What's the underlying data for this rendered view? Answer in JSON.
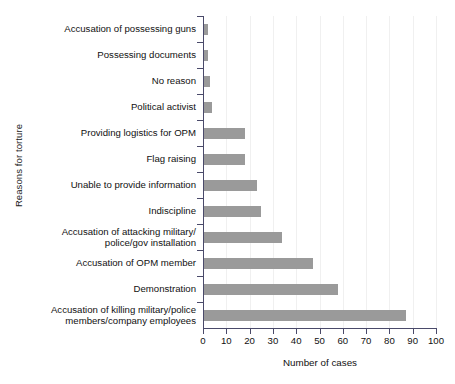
{
  "chart_data": {
    "type": "bar",
    "orientation": "horizontal",
    "title": "",
    "xlabel": "Number of cases",
    "ylabel": "Reasons for torture",
    "xlim": [
      0,
      100
    ],
    "xticks": [
      0,
      10,
      20,
      30,
      40,
      50,
      60,
      70,
      80,
      90,
      100
    ],
    "grid": true,
    "grid_axis": "x",
    "legend": false,
    "bar_color": "#9a9a9a",
    "axis_color": "#4a4a6a",
    "categories": [
      "Accusation of possessing guns",
      "Possessing documents",
      "No reason",
      "Political activist",
      "Providing logistics for OPM",
      "Flag raising",
      "Unable to provide information",
      "Indiscipline",
      "Accusation of attacking military/\npolice/gov installation",
      "Accusation of OPM member",
      "Demonstration",
      "Accusation of killing military/police\nmembers/company employees"
    ],
    "values": [
      2,
      2,
      3,
      4,
      18,
      18,
      23,
      25,
      34,
      47,
      58,
      87
    ]
  }
}
